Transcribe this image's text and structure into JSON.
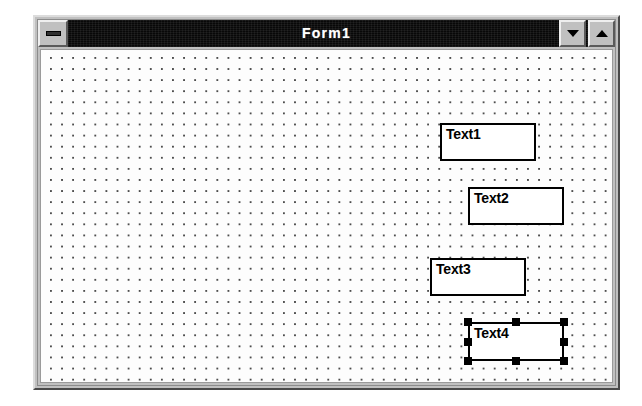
{
  "window": {
    "title": "Form1",
    "sysmenu_icon": "window-menu-bar-icon",
    "minimize_icon": "triangle-down-icon",
    "maximize_icon": "triangle-up-icon",
    "titlebar_color": "#080808",
    "titlebar_text_color": "#ffffff",
    "frame_color": "#c0c0c0",
    "client_background": "#fdfdfd",
    "grid_dot_color": "#4d4d4d",
    "grid_spacing_px": 11
  },
  "form": {
    "grid_visible": true,
    "controls": [
      {
        "name": "Text1",
        "caption": "Text1",
        "type": "textbox",
        "x": 399,
        "y": 73,
        "width": 96,
        "height": 38,
        "selected": false
      },
      {
        "name": "Text2",
        "caption": "Text2",
        "type": "textbox",
        "x": 427,
        "y": 137,
        "width": 96,
        "height": 38,
        "selected": false
      },
      {
        "name": "Text3",
        "caption": "Text3",
        "type": "textbox",
        "x": 389,
        "y": 208,
        "width": 96,
        "height": 38,
        "selected": false
      },
      {
        "name": "Text4",
        "caption": "Text4",
        "type": "textbox",
        "x": 427,
        "y": 272,
        "width": 96,
        "height": 39,
        "selected": true,
        "handle_color": "#000000",
        "handle_count": 8
      }
    ]
  }
}
